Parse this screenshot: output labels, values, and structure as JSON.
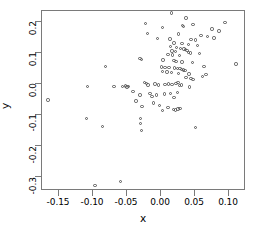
{
  "chart_data": {
    "type": "scatter",
    "title": "",
    "xlabel": "x",
    "ylabel": "y",
    "xlim": [
      -0.175,
      0.125
    ],
    "ylim": [
      -0.345,
      0.235
    ],
    "xticks": [
      -0.15,
      -0.1,
      -0.05,
      0.0,
      0.05,
      0.1
    ],
    "xticklabels": [
      "-0.15",
      "-0.10",
      "-0.05",
      "0.00",
      "0.05",
      "0.10"
    ],
    "yticks": [
      0.2,
      0.1,
      0.0,
      -0.1,
      -0.2,
      -0.3
    ],
    "yticklabels": [
      "0.2",
      "0.1",
      "0.0",
      "-0.1",
      "-0.2",
      "-0.3"
    ],
    "grid": false,
    "legend": null,
    "marker": "open-circle",
    "marker_color": "#555555",
    "frame_color": "#7a7a7a",
    "n_points": 112,
    "points": [
      [
        0.015,
        0.228
      ],
      [
        0.037,
        0.212
      ],
      [
        0.094,
        0.197
      ],
      [
        -0.023,
        0.194
      ],
      [
        0.047,
        0.192
      ],
      [
        0.032,
        0.189
      ],
      [
        0.033,
        0.186
      ],
      [
        0.002,
        0.182
      ],
      [
        0.075,
        0.177
      ],
      [
        0.085,
        0.17
      ],
      [
        -0.02,
        0.163
      ],
      [
        0.026,
        0.161
      ],
      [
        0.059,
        0.157
      ],
      [
        0.068,
        0.153
      ],
      [
        0.078,
        0.148
      ],
      [
        -0.005,
        0.147
      ],
      [
        0.013,
        0.145
      ],
      [
        0.044,
        0.144
      ],
      [
        0.051,
        0.141
      ],
      [
        0.019,
        0.132
      ],
      [
        0.031,
        0.13
      ],
      [
        0.04,
        0.127
      ],
      [
        0.054,
        0.124
      ],
      [
        0.014,
        0.121
      ],
      [
        0.023,
        0.117
      ],
      [
        0.029,
        0.114
      ],
      [
        0.034,
        0.112
      ],
      [
        0.036,
        0.11
      ],
      [
        0.038,
        0.108
      ],
      [
        0.016,
        0.106
      ],
      [
        0.021,
        0.104
      ],
      [
        0.04,
        0.102
      ],
      [
        0.043,
        0.1
      ],
      [
        0.057,
        0.098
      ],
      [
        0.01,
        0.095
      ],
      [
        0.017,
        0.093
      ],
      [
        0.027,
        0.091
      ],
      [
        -0.031,
        0.082
      ],
      [
        -0.029,
        0.079
      ],
      [
        0.003,
        0.077
      ],
      [
        0.019,
        0.075
      ],
      [
        0.022,
        0.073
      ],
      [
        0.031,
        0.071
      ],
      [
        0.046,
        0.069
      ],
      [
        -0.082,
        0.057
      ],
      [
        0.063,
        0.056
      ],
      [
        0.11,
        0.064
      ],
      [
        0.001,
        0.055
      ],
      [
        0.006,
        0.053
      ],
      [
        0.012,
        0.052
      ],
      [
        0.02,
        0.051
      ],
      [
        0.024,
        0.05
      ],
      [
        0.028,
        0.049
      ],
      [
        0.03,
        0.047
      ],
      [
        0.033,
        0.045
      ],
      [
        0.035,
        0.043
      ],
      [
        0.002,
        0.04
      ],
      [
        0.009,
        0.038
      ],
      [
        0.015,
        0.036
      ],
      [
        0.026,
        0.034
      ],
      [
        0.041,
        0.032
      ],
      [
        0.066,
        0.03
      ],
      [
        0.061,
        0.024
      ],
      [
        0.037,
        0.02
      ],
      [
        0.044,
        0.017
      ],
      [
        0.047,
        0.014
      ],
      [
        -0.108,
        -0.008
      ],
      [
        -0.069,
        -0.009
      ],
      [
        -0.057,
        -0.008
      ],
      [
        -0.052,
        -0.007
      ],
      [
        -0.05,
        -0.01
      ],
      [
        -0.048,
        -0.008
      ],
      [
        -0.024,
        0.005
      ],
      [
        -0.021,
        0.001
      ],
      [
        -0.019,
        -0.004
      ],
      [
        -0.009,
        0.0
      ],
      [
        -0.004,
        -0.003
      ],
      [
        0.006,
        -0.002
      ],
      [
        0.011,
        0.0
      ],
      [
        0.016,
        -0.001
      ],
      [
        0.022,
        0.002
      ],
      [
        0.025,
        0.004
      ],
      [
        0.027,
        -0.006
      ],
      [
        0.03,
        -0.004
      ],
      [
        0.042,
        -0.01
      ],
      [
        -0.166,
        -0.052
      ],
      [
        -0.041,
        -0.025
      ],
      [
        -0.031,
        -0.036
      ],
      [
        -0.016,
        -0.03
      ],
      [
        -0.013,
        -0.041
      ],
      [
        -0.007,
        -0.036
      ],
      [
        0.005,
        -0.033
      ],
      [
        0.014,
        -0.03
      ],
      [
        0.019,
        -0.044
      ],
      [
        0.024,
        -0.027
      ],
      [
        -0.037,
        -0.055
      ],
      [
        -0.028,
        -0.073
      ],
      [
        -0.011,
        -0.062
      ],
      [
        -0.002,
        -0.07
      ],
      [
        0.002,
        -0.085
      ],
      [
        0.01,
        -0.076
      ],
      [
        0.018,
        -0.082
      ],
      [
        0.021,
        -0.084
      ],
      [
        0.025,
        -0.081
      ],
      [
        0.028,
        -0.079
      ],
      [
        -0.11,
        -0.112
      ],
      [
        -0.03,
        -0.112
      ],
      [
        -0.03,
        -0.127
      ],
      [
        -0.086,
        -0.138
      ],
      [
        -0.029,
        -0.15
      ],
      [
        0.051,
        -0.141
      ],
      [
        -0.097,
        -0.328
      ],
      [
        -0.06,
        -0.315
      ]
    ]
  }
}
